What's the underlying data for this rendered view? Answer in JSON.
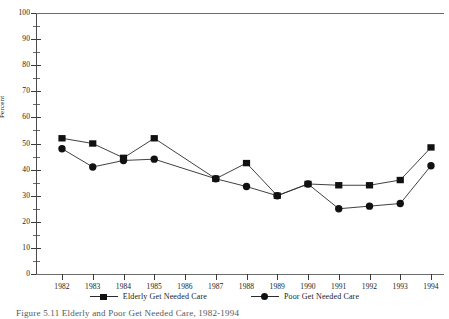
{
  "figure": {
    "caption": "Figure 5.11   Elderly and Poor Get Needed Care, 1982-1994"
  },
  "chart_data": {
    "type": "line",
    "title": "",
    "xlabel": "",
    "ylabel": "Percent",
    "ylim": [
      0,
      100
    ],
    "ytick_step": 10,
    "yminor_step": 5,
    "grid": false,
    "legend_position": "bottom-center",
    "categories": [
      "1982",
      "1983",
      "1984",
      "1985",
      "1986",
      "1987",
      "1988",
      "1989",
      "1990",
      "1991",
      "1992",
      "1993",
      "1994"
    ],
    "ytick_labels": [
      "0",
      "10",
      "20",
      "30",
      "40",
      "50",
      "60",
      "70",
      "80",
      "90",
      "100"
    ],
    "series": [
      {
        "name": "Elderly Get Needed Care",
        "marker": "square",
        "color": "#111111",
        "values": [
          52,
          50,
          44.5,
          52,
          null,
          36.5,
          42.5,
          30,
          34.5,
          34,
          34,
          36,
          48.5
        ]
      },
      {
        "name": "Poor Get Needed Care",
        "marker": "circle",
        "color": "#111111",
        "values": [
          48,
          41,
          43.5,
          44,
          null,
          36.5,
          33.5,
          30,
          34.5,
          25,
          26,
          27,
          41.5
        ]
      }
    ]
  }
}
